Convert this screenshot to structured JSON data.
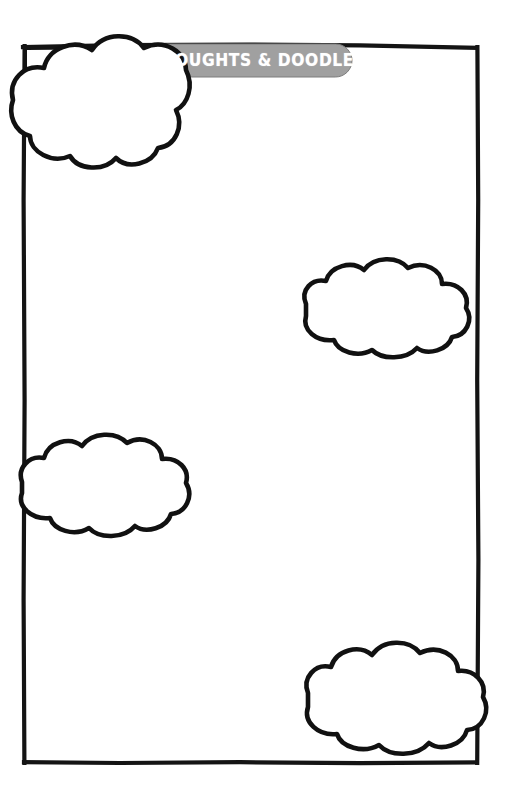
{
  "page": {
    "kind": "printable-worksheet",
    "width": 507,
    "height": 807,
    "background_color": "#ffffff",
    "ink_color": "#000000"
  },
  "frame": {
    "name": "hand-drawn-border",
    "style": "hand-drawn rectangle",
    "stroke_color": "#111111",
    "left": 24,
    "top": 45,
    "right": 477,
    "bottom": 762,
    "stroke_width": 4
  },
  "banner": {
    "title": "THOUGHTS  &  DOODLES",
    "title_plain": "THOUGHTS & DOODLES",
    "fill_color": "#a0a0a0",
    "text_color": "#ffffff",
    "shape": "rounded-rectangle",
    "left": 150,
    "top": 44,
    "width": 202,
    "height": 33
  },
  "clouds": [
    {
      "name": "cloud-top-left",
      "label": "thought bubble",
      "cx": 100,
      "cy": 103,
      "rx": 90,
      "ry": 62,
      "overlaps": "top-left-corner"
    },
    {
      "name": "cloud-middle-right",
      "label": "thought bubble",
      "cx": 388,
      "cy": 312,
      "rx": 84,
      "ry": 47,
      "overlaps": "none"
    },
    {
      "name": "cloud-middle-left",
      "label": "thought bubble",
      "cx": 105,
      "cy": 492,
      "rx": 84,
      "ry": 50,
      "overlaps": "left-border"
    },
    {
      "name": "cloud-bottom-right",
      "label": "thought bubble",
      "cx": 392,
      "cy": 700,
      "rx": 86,
      "ry": 54,
      "overlaps": "right-border"
    }
  ],
  "writing_area": {
    "name": "blank-writing-space",
    "content": "",
    "placeholder": ""
  }
}
